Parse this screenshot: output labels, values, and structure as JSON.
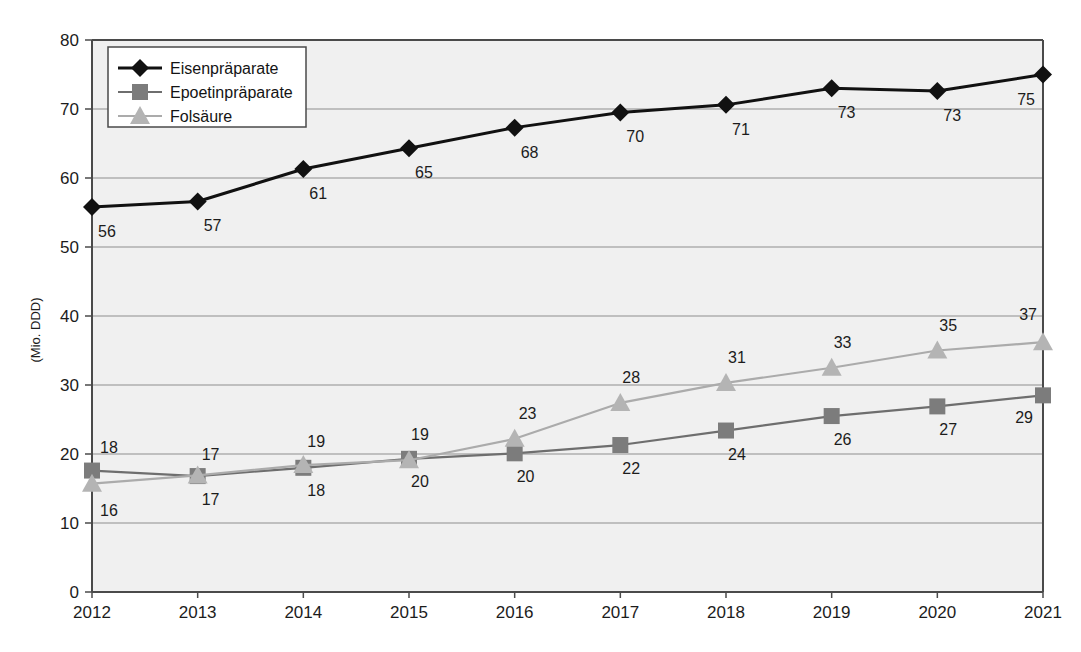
{
  "chart_data": {
    "type": "line",
    "title": "",
    "xlabel": "",
    "ylabel": "(Mio. DDD)",
    "categories": [
      "2012",
      "2013",
      "2014",
      "2015",
      "2016",
      "2017",
      "2018",
      "2019",
      "2020",
      "2021"
    ],
    "x": [
      2012,
      2013,
      2014,
      2015,
      2016,
      2017,
      2018,
      2019,
      2020,
      2021
    ],
    "ylim": [
      0,
      80
    ],
    "yticks": [
      0,
      10,
      20,
      30,
      40,
      50,
      60,
      70,
      80
    ],
    "ytick_labels": [
      "0",
      "10",
      "20",
      "30",
      "40",
      "50",
      "60",
      "70",
      "80"
    ],
    "grid": true,
    "legend_position": "top-left",
    "series": [
      {
        "name": "Eisenpräparate",
        "marker": "diamond",
        "color": "#111111",
        "line_color": "#111111",
        "values": [
          56,
          57,
          61,
          65,
          68,
          70,
          71,
          73,
          73,
          75
        ],
        "labels": [
          "56",
          "57",
          "61",
          "65",
          "68",
          "70",
          "71",
          "73",
          "73",
          "75"
        ],
        "plot_values": [
          55.8,
          56.6,
          61.3,
          64.3,
          67.3,
          69.5,
          70.6,
          73.0,
          72.6,
          75.0
        ]
      },
      {
        "name": "Epoetinpräparate",
        "marker": "square",
        "color": "#7c7c7c",
        "line_color": "#6e6e6e",
        "values": [
          18,
          17,
          18,
          20,
          20,
          22,
          24,
          26,
          27,
          29
        ],
        "labels": [
          "18",
          "17",
          "18",
          "20",
          "20",
          "22",
          "24",
          "26",
          "27",
          "29"
        ],
        "plot_values": [
          17.6,
          16.8,
          18.0,
          19.3,
          20.1,
          21.3,
          23.4,
          25.5,
          26.9,
          28.5
        ]
      },
      {
        "name": "Folsäure",
        "marker": "triangle",
        "color": "#b4b4b4",
        "line_color": "#ababab",
        "values": [
          16,
          17,
          19,
          19,
          23,
          28,
          31,
          33,
          35,
          37
        ],
        "labels": [
          "16",
          "17",
          "19",
          "19",
          "23",
          "28",
          "31",
          "33",
          "35",
          "37"
        ],
        "plot_values": [
          15.7,
          16.9,
          18.4,
          19.1,
          22.2,
          27.4,
          30.3,
          32.5,
          35.0,
          36.2
        ]
      }
    ]
  },
  "legend": {
    "items": [
      {
        "label": "Eisenpräparate"
      },
      {
        "label": "Epoetinpräparate"
      },
      {
        "label": "Folsäure"
      }
    ]
  },
  "colors": {
    "plot_background": "#f0f0f0",
    "grid": "#8e8e8e",
    "axis": "#4a4a4a",
    "series_1": "#111111",
    "series_2": "#7c7c7c",
    "series_3": "#b4b4b4",
    "page_background": "#ffffff"
  }
}
